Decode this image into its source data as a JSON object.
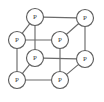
{
  "figure": {
    "type": "graph-diagram",
    "background_color": "#ffffff",
    "edge_color": "#6b6b6b",
    "node_fill_color": "#ffffff",
    "node_stroke_color": "#5e5e5e",
    "label_color": "#3a3a3a",
    "node_radius": 8.5
  },
  "graph_data": {
    "type": "graph",
    "description": "Cube graph drawn in oblique projection: eight vertices each labeled P, joined by twelve edges forming front square, back square and four connecting struts.",
    "node_count": 8,
    "edge_count": 12,
    "nodes": [
      {
        "id": "back-top-left",
        "label": "P",
        "x": 35,
        "y": 17
      },
      {
        "id": "back-top-right",
        "label": "P",
        "x": 85,
        "y": 18
      },
      {
        "id": "back-bottom-left",
        "label": "P",
        "x": 35,
        "y": 58
      },
      {
        "id": "back-bottom-right",
        "label": "P",
        "x": 85,
        "y": 59
      },
      {
        "id": "front-top-left",
        "label": "P",
        "x": 17,
        "y": 40
      },
      {
        "id": "front-top-right",
        "label": "P",
        "x": 60,
        "y": 40
      },
      {
        "id": "front-bottom-left",
        "label": "P",
        "x": 17,
        "y": 80
      },
      {
        "id": "front-bottom-right",
        "label": "P",
        "x": 60,
        "y": 80
      }
    ],
    "edges": [
      {
        "id": "edge-back-top",
        "from": "back-top-left",
        "to": "back-top-right",
        "x1": 35,
        "y1": 17,
        "x2": 85,
        "y2": 18
      },
      {
        "id": "edge-back-left",
        "from": "back-top-left",
        "to": "back-bottom-left",
        "x1": 35,
        "y1": 17,
        "x2": 35,
        "y2": 58
      },
      {
        "id": "edge-back-right",
        "from": "back-top-right",
        "to": "back-bottom-right",
        "x1": 85,
        "y1": 18,
        "x2": 85,
        "y2": 59
      },
      {
        "id": "edge-back-bottom",
        "from": "back-bottom-left",
        "to": "back-bottom-right",
        "x1": 35,
        "y1": 58,
        "x2": 85,
        "y2": 59
      },
      {
        "id": "edge-front-top",
        "from": "front-top-left",
        "to": "front-top-right",
        "x1": 17,
        "y1": 40,
        "x2": 60,
        "y2": 40
      },
      {
        "id": "edge-front-left",
        "from": "front-top-left",
        "to": "front-bottom-left",
        "x1": 17,
        "y1": 40,
        "x2": 17,
        "y2": 80
      },
      {
        "id": "edge-front-right",
        "from": "front-top-right",
        "to": "front-bottom-right",
        "x1": 60,
        "y1": 40,
        "x2": 60,
        "y2": 80
      },
      {
        "id": "edge-front-bottom",
        "from": "front-bottom-left",
        "to": "front-bottom-right",
        "x1": 17,
        "y1": 80,
        "x2": 60,
        "y2": 80
      },
      {
        "id": "edge-strut-top-left",
        "from": "front-top-left",
        "to": "back-top-left",
        "x1": 17,
        "y1": 40,
        "x2": 35,
        "y2": 17
      },
      {
        "id": "edge-strut-top-right",
        "from": "front-top-right",
        "to": "back-top-right",
        "x1": 60,
        "y1": 40,
        "x2": 85,
        "y2": 18
      },
      {
        "id": "edge-strut-bot-left",
        "from": "front-bottom-left",
        "to": "back-bottom-left",
        "x1": 17,
        "y1": 80,
        "x2": 35,
        "y2": 58
      },
      {
        "id": "edge-strut-bot-right",
        "from": "front-bottom-right",
        "to": "back-bottom-right",
        "x1": 60,
        "y1": 80,
        "x2": 85,
        "y2": 59
      }
    ]
  }
}
